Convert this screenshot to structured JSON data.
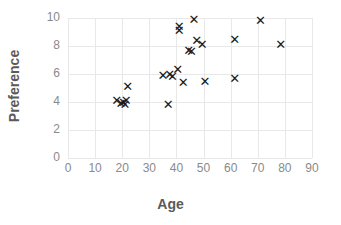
{
  "chart_data": {
    "type": "scatter",
    "title": "",
    "xlabel": "Age",
    "ylabel": "Preference",
    "xlim": [
      0,
      90
    ],
    "ylim": [
      0,
      10
    ],
    "xticks": [
      0,
      10,
      20,
      30,
      40,
      50,
      60,
      70,
      80,
      90
    ],
    "yticks": [
      0,
      2,
      4,
      6,
      8,
      10
    ],
    "grid": true,
    "legend": "none",
    "marker": "x",
    "marker_color": "#1a1a1a",
    "grid_color": "#e8e8e8",
    "tick_color": "#8a8a8a",
    "title_color": "#5a5a5a",
    "points": [
      {
        "x": 18.0,
        "y": 4.1
      },
      {
        "x": 19.5,
        "y": 3.9
      },
      {
        "x": 20.5,
        "y": 4.0
      },
      {
        "x": 21.5,
        "y": 4.1
      },
      {
        "x": 21.0,
        "y": 3.8
      },
      {
        "x": 22.0,
        "y": 5.1
      },
      {
        "x": 35.0,
        "y": 5.9
      },
      {
        "x": 37.0,
        "y": 3.8
      },
      {
        "x": 37.5,
        "y": 6.0
      },
      {
        "x": 38.5,
        "y": 5.8
      },
      {
        "x": 40.5,
        "y": 6.3
      },
      {
        "x": 41.0,
        "y": 9.4
      },
      {
        "x": 41.0,
        "y": 9.1
      },
      {
        "x": 42.5,
        "y": 5.4
      },
      {
        "x": 44.5,
        "y": 7.7
      },
      {
        "x": 45.5,
        "y": 7.6
      },
      {
        "x": 46.5,
        "y": 9.9
      },
      {
        "x": 47.5,
        "y": 8.4
      },
      {
        "x": 49.5,
        "y": 8.1
      },
      {
        "x": 50.5,
        "y": 5.5
      },
      {
        "x": 61.5,
        "y": 5.7
      },
      {
        "x": 61.5,
        "y": 8.5
      },
      {
        "x": 71.0,
        "y": 9.8
      },
      {
        "x": 78.5,
        "y": 8.1
      }
    ]
  },
  "axes": {
    "x_title": "Age",
    "y_title": "Preference",
    "x_tick_labels": [
      "0",
      "10",
      "20",
      "30",
      "40",
      "50",
      "60",
      "70",
      "80",
      "90"
    ],
    "y_tick_labels": [
      "0",
      "2",
      "4",
      "6",
      "8",
      "10"
    ]
  },
  "marker_glyph": "✕"
}
